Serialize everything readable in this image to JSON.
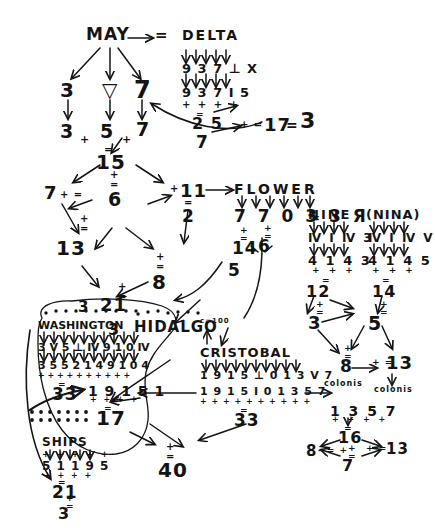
{
  "document": {
    "kind": "handwritten-cipher-worksheet",
    "title": "MAY / DELTA / FLOWER / NINE / WASHINGTON / CRISTOBAL numerology notes",
    "ink_color": "#141414",
    "paper_color": "#ffffff"
  },
  "nodes": {
    "may": {
      "word": "MAY",
      "arrow_label": "=",
      "letters": [
        "3",
        "▽",
        "7"
      ],
      "digits": [
        "3",
        "5",
        "7"
      ],
      "ops": [
        "+",
        "+"
      ],
      "eq": "=",
      "sum": "15"
    },
    "delta": {
      "word": "DELTA",
      "row1": "9 3 7 ⊥ Ⅹ",
      "row2": "9 3 7 I 5",
      "ops": "+ + + +",
      "eq": "=",
      "sum": "2 5",
      "reduce": "7",
      "chain_op": "+ =",
      "chain_value": "17",
      "chain_eq": "=",
      "chain_result": "3"
    },
    "fifteen": {
      "value": "15",
      "op": "+",
      "eq": "=",
      "reduce": "6",
      "left_branch": "7",
      "left_op": "+ =",
      "right_branch": "11",
      "right_op": "+",
      "right_eq": "=",
      "right_reduce": "2"
    },
    "thirteen": {
      "value": "13",
      "op": "+",
      "eq": "=",
      "next": "21",
      "next_op": "+",
      "next_eq": "=",
      "next_reduce": "3"
    },
    "eight": {
      "value": "8",
      "op": "+",
      "eq": "="
    },
    "flower": {
      "word": "FLOWER",
      "digits": "7 7 0 3 3 Я",
      "eq": "=",
      "left_sum": "14",
      "left_op": "+",
      "left_eq": "=",
      "left_reduce": "5",
      "mid_op": "+",
      "mid_eq": "=",
      "mid_reduce": "6"
    },
    "nine": {
      "word": "NINE",
      "row1": "Ⅳ I Ⅳ 3",
      "digits": "4 1 4 3",
      "ops": "+ + +",
      "eq": "=",
      "sum": "12",
      "sum_op": "+",
      "sum_eq": "=",
      "reduce": "3"
    },
    "nina": {
      "word": "(NINA)",
      "row1": "Ⅳ I Ⅳ Ⅴ",
      "digits": "4 1 4 5",
      "ops": "+ + +",
      "eq": "=",
      "sum": "14",
      "sum_op": "+",
      "sum_eq": "=",
      "reduce": "5"
    },
    "colonis_left": {
      "op": "+",
      "eq": "=",
      "value": "8",
      "label": "colonis"
    },
    "colonis_right": {
      "op": "+ =",
      "value": "13",
      "label": "colonis"
    },
    "washington": {
      "word": "WASHINGTON",
      "top_value": "3",
      "row1": "3 Ⅴ 5 ⊥ Ⅳ 9 1 0 Ⅳ",
      "digits": "3 5 5 2 1 4 9 1 0 4",
      "ops": "+ + + + + + + + + +",
      "eq": "=",
      "sum": "33"
    },
    "hidalgo": {
      "word": "HIDALGO"
    },
    "cristobal": {
      "word": "CRISTOBAL",
      "note": "c=100",
      "row1": "1 9 1 5 ⊥ 0 1 3 Ⅴ 7",
      "digits": "1 9 1 5 I 0 1 3 5 7",
      "ops": "+ + + + + + + + + +",
      "eq": "=",
      "sum": "33"
    },
    "nineteen_fifty_one": {
      "digits": "1 9 1 5 1",
      "ops": "+ + + +",
      "eq": "=",
      "sum": "17"
    },
    "ships": {
      "word": "SHIPS",
      "ops_top": "+ + + + +",
      "digits": "5 1 1 9 5",
      "ops": "+ + + +",
      "eq": "=",
      "sum": "21",
      "sum_op": "+",
      "sum_eq": "=",
      "reduce": "3"
    },
    "forty": {
      "op": "+",
      "eq": "=",
      "value": "40"
    },
    "one_three_five_seven": {
      "digits": "1 3 5 7",
      "ops": "+ + + +",
      "eq": "=",
      "sum": "16",
      "sum_op": "+",
      "sum_eq": "=",
      "reduce": "7",
      "left_value": "8",
      "left_op": "- = +",
      "right_op": "+ =",
      "right_value": "13"
    }
  }
}
